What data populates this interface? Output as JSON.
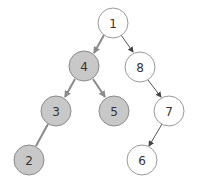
{
  "diagram": {
    "type": "binary-tree",
    "colors": {
      "highlight_fill": "#c8c8c8",
      "highlight_stroke": "#8a8a8a",
      "normal_fill": "#ffffff",
      "normal_stroke": "#9a9a9a",
      "highlight_edge": "#8a8a8a",
      "normal_edge": "#555555",
      "label": "#333333"
    },
    "nodes": [
      {
        "id": "1",
        "label": "1",
        "x": 113,
        "y": 23,
        "highlighted": false
      },
      {
        "id": "4",
        "label": "4",
        "x": 84,
        "y": 66,
        "highlighted": true
      },
      {
        "id": "8",
        "label": "8",
        "x": 140,
        "y": 67,
        "highlighted": false
      },
      {
        "id": "3",
        "label": "3",
        "x": 56,
        "y": 111,
        "highlighted": true
      },
      {
        "id": "5",
        "label": "5",
        "x": 114,
        "y": 111,
        "highlighted": true
      },
      {
        "id": "7",
        "label": "7",
        "x": 169,
        "y": 111,
        "highlighted": false
      },
      {
        "id": "2",
        "label": "2",
        "x": 29,
        "y": 160,
        "highlighted": true
      },
      {
        "id": "6",
        "label": "6",
        "x": 142,
        "y": 160,
        "highlighted": false
      }
    ],
    "edges": [
      {
        "from": "1",
        "to": "4",
        "highlighted": true
      },
      {
        "from": "1",
        "to": "8",
        "highlighted": false
      },
      {
        "from": "4",
        "to": "3",
        "highlighted": true
      },
      {
        "from": "4",
        "to": "5",
        "highlighted": true
      },
      {
        "from": "8",
        "to": "7",
        "highlighted": false
      },
      {
        "from": "3",
        "to": "2",
        "highlighted": true
      },
      {
        "from": "7",
        "to": "6",
        "highlighted": false
      }
    ]
  }
}
